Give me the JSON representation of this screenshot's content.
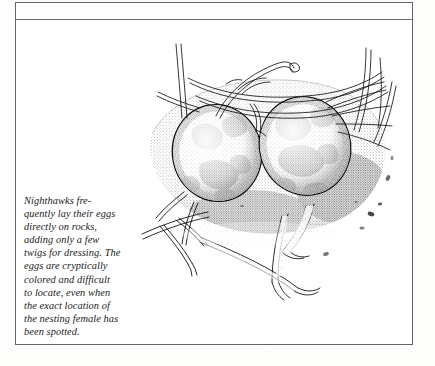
{
  "page": {
    "background_color": "#fdfdfc",
    "frame_color": "#63636a"
  },
  "figure": {
    "caption": "Nighthawks fre-\nquently lay their eggs\ndirectly on rocks,\nadding only a few\ntwigs for dressing. The\neggs are cryptically\ncolored and difficult\nto locate, even when\nthe exact location of\nthe nesting female has\nbeen spotted.",
    "illustration": {
      "name": "nighthawk-eggs-nest-illustration",
      "medium": "pen-and-ink stipple drawing",
      "subject": "two speckled nighthawk eggs resting on a rock with scattered twigs and grass blades",
      "ink_color": "#111111",
      "elements": [
        "egg-left",
        "egg-right",
        "rock-ground-stipple",
        "grass-blades-upper",
        "twigs-lower",
        "pebble-debris"
      ]
    }
  }
}
